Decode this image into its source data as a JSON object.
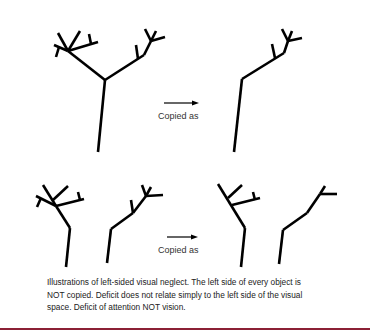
{
  "figure": {
    "top_row": {
      "arrow_label": "Copied as",
      "original": "two-branch tree",
      "copy": "right half of tree only"
    },
    "bottom_row": {
      "arrow_label": "Copied as",
      "original": "two separate half-trees",
      "copy": "right half of each object only"
    },
    "caption": "Illustrations of left-sided visual neglect. The left side of every object is NOT copied. Deficit does not relate simply to the left side of the visual space. Deficit of attention NOT vision.",
    "colors": {
      "stroke": "#000000",
      "text": "#222222",
      "rule": "#8b2035"
    }
  }
}
